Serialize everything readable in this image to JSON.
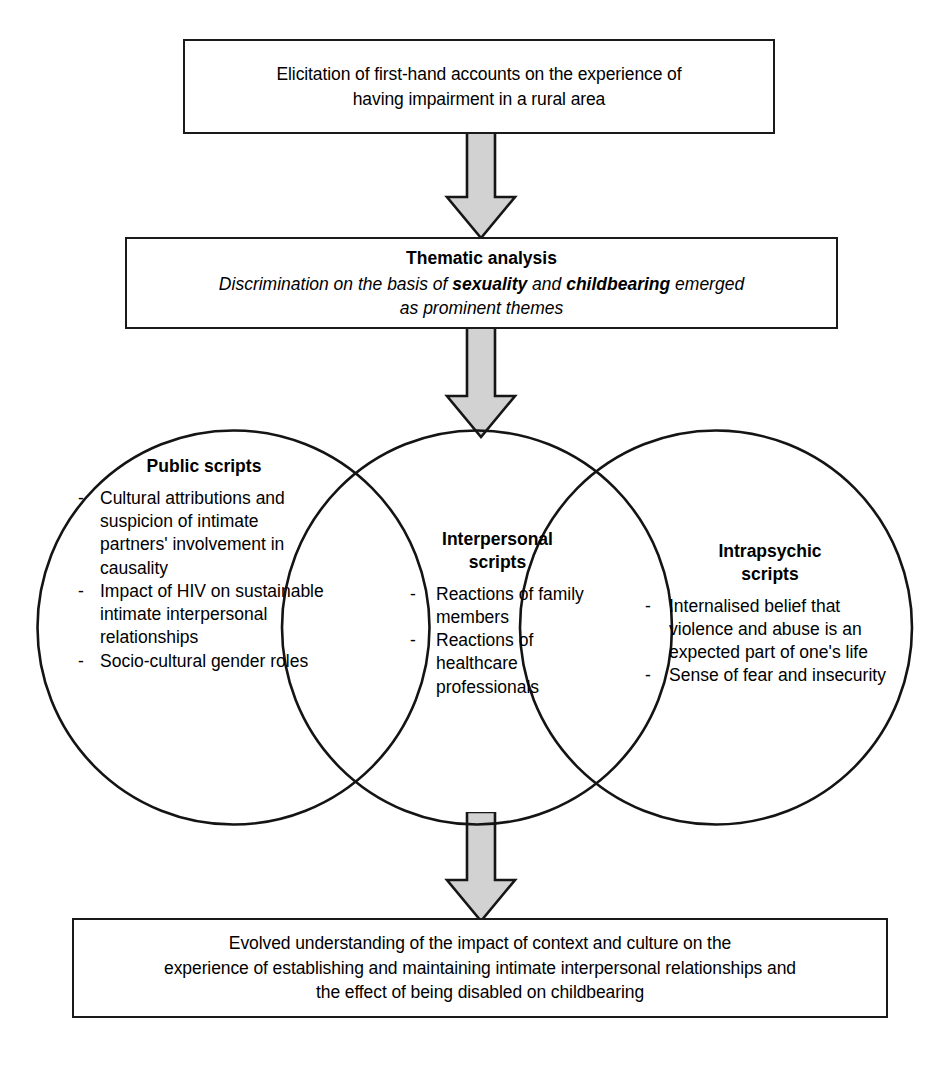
{
  "diagram": {
    "colors": {
      "arrow_fill": "#d2d2d2",
      "outline": "#141414",
      "background": "#ffffff"
    },
    "top_box": {
      "lines": [
        "Elicitation of first-hand accounts on the experience of",
        "having impairment in a rural area"
      ]
    },
    "thematic_box": {
      "heading": "Thematic analysis",
      "italic_line_1_pre": "Discrimination on the basis of ",
      "italic_bold_1": "sexuality",
      "italic_line_1_mid": " and ",
      "italic_bold_2": "childbearing",
      "italic_line_1_post": " emerged",
      "italic_line_2": "as prominent themes"
    },
    "circles": [
      {
        "id": "public-scripts",
        "title": "Public scripts",
        "items": [
          "Cultural attributions and suspicion of intimate partners' involvement in causality",
          "Impact of HIV on sustainable intimate interpersonal relationships",
          "Socio-cultural gender roles"
        ]
      },
      {
        "id": "interpersonal-scripts",
        "title_line_1": "Interpersonal",
        "title_line_2": "scripts",
        "items": [
          "Reactions of family members",
          "Reactions of healthcare professionals"
        ]
      },
      {
        "id": "intrapsychic-scripts",
        "title_line_1": "Intrapsychic",
        "title_line_2": "scripts",
        "items": [
          "Internalised belief that violence and abuse is an expected part of one's life",
          "Sense of fear and insecurity"
        ]
      }
    ],
    "bottom_box": {
      "lines": [
        "Evolved understanding of the impact of context and culture on the",
        "experience of establishing and maintaining intimate interpersonal relationships and",
        "the effect of being disabled on childbearing"
      ]
    },
    "arrows": [
      {
        "id": "arrow-top-to-thematic",
        "label": "downward-arrow"
      },
      {
        "id": "arrow-thematic-to-circles",
        "label": "downward-arrow"
      },
      {
        "id": "arrow-circles-to-bottom",
        "label": "downward-arrow"
      }
    ]
  }
}
